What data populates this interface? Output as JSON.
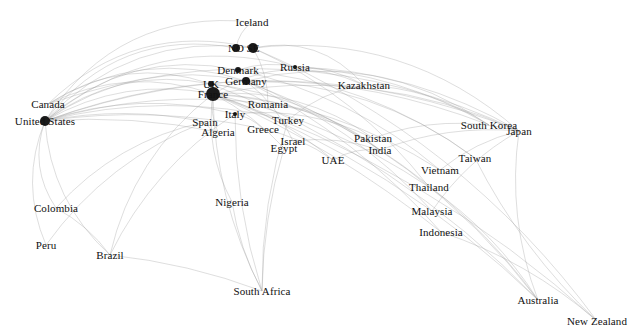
{
  "chart_data": {
    "type": "scatter",
    "title": "",
    "subtitle": "",
    "xlabel": "",
    "ylabel": "",
    "grid": false,
    "legend": "none",
    "background": "#ffffff",
    "edge_color": "#9a9a9a",
    "node_color": "#1a1a1a",
    "label_color": "#111111",
    "xlim": [
      0,
      639
    ],
    "ylim": [
      0,
      336
    ],
    "annotations": [],
    "nodes": [
      {
        "label": "Iceland",
        "x": 252,
        "y": 22,
        "size": 0
      },
      {
        "label": "NO",
        "x": 236,
        "y": 48,
        "size": 4
      },
      {
        "label": "SE",
        "x": 253,
        "y": 48,
        "size": 5
      },
      {
        "label": "Denmark",
        "x": 238,
        "y": 70,
        "size": 3
      },
      {
        "label": "Russia",
        "x": 295,
        "y": 67,
        "size": 2
      },
      {
        "label": "UK",
        "x": 211,
        "y": 84,
        "size": 3
      },
      {
        "label": "Germany",
        "x": 246,
        "y": 81,
        "size": 4
      },
      {
        "label": "France",
        "x": 213,
        "y": 94,
        "size": 7
      },
      {
        "label": "Kazakhstan",
        "x": 364,
        "y": 85,
        "size": 0
      },
      {
        "label": "Romania",
        "x": 268,
        "y": 104,
        "size": 0
      },
      {
        "label": "Italy",
        "x": 235,
        "y": 114,
        "size": 2
      },
      {
        "label": "Canada",
        "x": 48,
        "y": 104,
        "size": 0
      },
      {
        "label": "United States",
        "x": 45,
        "y": 121,
        "size": 5
      },
      {
        "label": "Spain",
        "x": 205,
        "y": 122,
        "size": 0
      },
      {
        "label": "Turkey",
        "x": 288,
        "y": 120,
        "size": 0
      },
      {
        "label": "Greece",
        "x": 263,
        "y": 129,
        "size": 0
      },
      {
        "label": "Algeria",
        "x": 218,
        "y": 132,
        "size": 0
      },
      {
        "label": "South Korea",
        "x": 489,
        "y": 125,
        "size": 0
      },
      {
        "label": "Japan",
        "x": 519,
        "y": 131,
        "size": 0
      },
      {
        "label": "Israel",
        "x": 293,
        "y": 141,
        "size": 0
      },
      {
        "label": "Egypt",
        "x": 284,
        "y": 148,
        "size": 0
      },
      {
        "label": "Pakistan",
        "x": 373,
        "y": 138,
        "size": 0
      },
      {
        "label": "India",
        "x": 380,
        "y": 150,
        "size": 0
      },
      {
        "label": "UAE",
        "x": 333,
        "y": 160,
        "size": 0
      },
      {
        "label": "Taiwan",
        "x": 475,
        "y": 158,
        "size": 0
      },
      {
        "label": "Vietnam",
        "x": 440,
        "y": 170,
        "size": 0
      },
      {
        "label": "Thailand",
        "x": 429,
        "y": 187,
        "size": 0
      },
      {
        "label": "Nigeria",
        "x": 232,
        "y": 202,
        "size": 0
      },
      {
        "label": "Colombia",
        "x": 56,
        "y": 208,
        "size": 0
      },
      {
        "label": "Malaysia",
        "x": 432,
        "y": 211,
        "size": 0
      },
      {
        "label": "Indonesia",
        "x": 441,
        "y": 232,
        "size": 0
      },
      {
        "label": "Peru",
        "x": 46,
        "y": 245,
        "size": 0
      },
      {
        "label": "Brazil",
        "x": 110,
        "y": 255,
        "size": 0
      },
      {
        "label": "South Africa",
        "x": 262,
        "y": 291,
        "size": 0
      },
      {
        "label": "Australia",
        "x": 538,
        "y": 300,
        "size": 0
      },
      {
        "label": "New Zealand",
        "x": 597,
        "y": 321,
        "size": 0
      }
    ],
    "edges": [
      {
        "from": "United States",
        "to": "Iceland",
        "curve": -70
      },
      {
        "from": "United States",
        "to": "NO",
        "curve": -62
      },
      {
        "from": "United States",
        "to": "SE",
        "curve": -56
      },
      {
        "from": "United States",
        "to": "Denmark",
        "curve": -50
      },
      {
        "from": "United States",
        "to": "Germany",
        "curve": -44
      },
      {
        "from": "United States",
        "to": "UK",
        "curve": -38
      },
      {
        "from": "United States",
        "to": "France",
        "curve": -32
      },
      {
        "from": "United States",
        "to": "Italy",
        "curve": -28
      },
      {
        "from": "United States",
        "to": "Russia",
        "curve": -66
      },
      {
        "from": "United States",
        "to": "Romania",
        "curve": -24
      },
      {
        "from": "United States",
        "to": "Spain",
        "curve": -16
      },
      {
        "from": "United States",
        "to": "Turkey",
        "curve": -30
      },
      {
        "from": "United States",
        "to": "Greece",
        "curve": -20
      },
      {
        "from": "United States",
        "to": "Algeria",
        "curve": -12
      },
      {
        "from": "Canada",
        "to": "SE",
        "curve": -58
      },
      {
        "from": "Canada",
        "to": "Germany",
        "curve": -46
      },
      {
        "from": "Canada",
        "to": "France",
        "curve": -34
      },
      {
        "from": "Canada",
        "to": "UK",
        "curve": -40
      },
      {
        "from": "France",
        "to": "Kazakhstan",
        "curve": -40
      },
      {
        "from": "France",
        "to": "Pakistan",
        "curve": -30
      },
      {
        "from": "France",
        "to": "India",
        "curve": -26
      },
      {
        "from": "SE",
        "to": "Kazakhstan",
        "curve": -34
      },
      {
        "from": "Germany",
        "to": "South Korea",
        "curve": -56
      },
      {
        "from": "SE",
        "to": "Japan",
        "curve": -62
      },
      {
        "from": "France",
        "to": "Japan",
        "curve": -48
      },
      {
        "from": "Germany",
        "to": "Taiwan",
        "curve": -40
      },
      {
        "from": "France",
        "to": "Vietnam",
        "curve": -30
      },
      {
        "from": "France",
        "to": "Thailand",
        "curve": -22
      },
      {
        "from": "France",
        "to": "UAE",
        "curve": -14
      },
      {
        "from": "Germany",
        "to": "Malaysia",
        "curve": -26
      },
      {
        "from": "France",
        "to": "Indonesia",
        "curve": -18
      },
      {
        "from": "France",
        "to": "Australia",
        "curve": -40
      },
      {
        "from": "Germany",
        "to": "Australia",
        "curve": -52
      },
      {
        "from": "SE",
        "to": "New Zealand",
        "curve": -60
      },
      {
        "from": "France",
        "to": "New Zealand",
        "curve": -46
      },
      {
        "from": "France",
        "to": "South Africa",
        "curve": 24
      },
      {
        "from": "Italy",
        "to": "South Africa",
        "curve": 14
      },
      {
        "from": "France",
        "to": "Nigeria",
        "curve": 18
      },
      {
        "from": "United States",
        "to": "Colombia",
        "curve": 22
      },
      {
        "from": "United States",
        "to": "Peru",
        "curve": 26
      },
      {
        "from": "United States",
        "to": "Brazil",
        "curve": 30
      },
      {
        "from": "France",
        "to": "Brazil",
        "curve": 34
      },
      {
        "from": "Spain",
        "to": "Colombia",
        "curve": 28
      },
      {
        "from": "Spain",
        "to": "Peru",
        "curve": 30
      },
      {
        "from": "Italy",
        "to": "Brazil",
        "curve": 26
      },
      {
        "from": "United States",
        "to": "Japan",
        "curve": -90
      },
      {
        "from": "United States",
        "to": "South Korea",
        "curve": -84
      },
      {
        "from": "Canada",
        "to": "Japan",
        "curve": -96
      },
      {
        "from": "India",
        "to": "Australia",
        "curve": -20
      },
      {
        "from": "Thailand",
        "to": "Australia",
        "curve": -16
      },
      {
        "from": "Indonesia",
        "to": "New Zealand",
        "curve": -18
      },
      {
        "from": "Japan",
        "to": "Australia",
        "curve": 22
      },
      {
        "from": "Taiwan",
        "to": "New Zealand",
        "curve": 18
      },
      {
        "from": "Egypt",
        "to": "South Africa",
        "curve": 10
      },
      {
        "from": "Turkey",
        "to": "South Africa",
        "curve": 14
      },
      {
        "from": "Kazakhstan",
        "to": "South Korea",
        "curve": -18
      },
      {
        "from": "Russia",
        "to": "Japan",
        "curve": -30
      },
      {
        "from": "Russia",
        "to": "Kazakhstan",
        "curve": -10
      },
      {
        "from": "UAE",
        "to": "India",
        "curve": -8
      },
      {
        "from": "Pakistan",
        "to": "Japan",
        "curve": -22
      },
      {
        "from": "India",
        "to": "Japan",
        "curve": -16
      },
      {
        "from": "Vietnam",
        "to": "Japan",
        "curve": -10
      },
      {
        "from": "Malaysia",
        "to": "Japan",
        "curve": -14
      },
      {
        "from": "Israel",
        "to": "India",
        "curve": -10
      },
      {
        "from": "Greece",
        "to": "UAE",
        "curve": -8
      },
      {
        "from": "Nigeria",
        "to": "South Africa",
        "curve": 8
      },
      {
        "from": "Brazil",
        "to": "South Africa",
        "curve": -10
      },
      {
        "from": "Colombia",
        "to": "Brazil",
        "curve": -8
      },
      {
        "from": "UK",
        "to": "Romania",
        "curve": -8
      },
      {
        "from": "Denmark",
        "to": "Russia",
        "curve": -8
      },
      {
        "from": "NO",
        "to": "Iceland",
        "curve": -6
      },
      {
        "from": "SE",
        "to": "Romania",
        "curve": -8
      },
      {
        "from": "Germany",
        "to": "Israel",
        "curve": -10
      },
      {
        "from": "France",
        "to": "Egypt",
        "curve": -8
      },
      {
        "from": "France",
        "to": "Algeria",
        "curve": 6
      },
      {
        "from": "Spain",
        "to": "Algeria",
        "curve": 4
      },
      {
        "from": "Italy",
        "to": "Greece",
        "curve": -5
      },
      {
        "from": "Turkey",
        "to": "Kazakhstan",
        "curve": -12
      },
      {
        "from": "Germany",
        "to": "Indonesia",
        "curve": -24
      },
      {
        "from": "SE",
        "to": "Thailand",
        "curve": -28
      },
      {
        "from": "UK",
        "to": "India",
        "curve": -24
      },
      {
        "from": "UK",
        "to": "Australia",
        "curve": -44
      },
      {
        "from": "Denmark",
        "to": "Taiwan",
        "curve": -36
      },
      {
        "from": "Denmark",
        "to": "Vietnam",
        "curve": -28
      },
      {
        "from": "Italy",
        "to": "Pakistan",
        "curve": -20
      },
      {
        "from": "Romania",
        "to": "India",
        "curve": -18
      },
      {
        "from": "Russia",
        "to": "South Korea",
        "curve": -24
      }
    ]
  }
}
